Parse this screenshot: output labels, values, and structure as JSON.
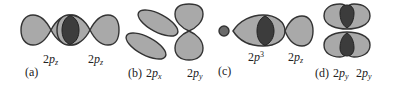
{
  "colors": {
    "lobe_fill": "#a9a9a9",
    "overlap_fill": "#3c3c3c",
    "outline": "#333333",
    "background": "#ffffff"
  },
  "panels": [
    {
      "id": "a",
      "tag": "(a)",
      "orbitals": [
        {
          "prefix": "2",
          "letter": "p",
          "sub": "z"
        },
        {
          "prefix": "2",
          "letter": "p",
          "sub": "z"
        }
      ],
      "description": "sigma overlap of two 2pz orbitals end-on"
    },
    {
      "id": "b",
      "tag": "(b)",
      "orbitals": [
        {
          "prefix": "2",
          "letter": "p",
          "sub": "x"
        },
        {
          "prefix": "2",
          "letter": "p",
          "sub": "y"
        }
      ],
      "description": "orthogonal 2px and 2py, no net overlap"
    },
    {
      "id": "c",
      "tag": "(c)",
      "orbitals": [
        {
          "prefix": "2",
          "letter": "p",
          "sup": "3"
        },
        {
          "prefix": "2",
          "letter": "p",
          "sub": "z"
        }
      ],
      "description": "sigma overlap of sp3 hybrid with 2pz"
    },
    {
      "id": "d",
      "tag": "(d)",
      "orbitals": [
        {
          "prefix": "2",
          "letter": "p",
          "sub": "y"
        },
        {
          "prefix": "2",
          "letter": "p",
          "sub": "y"
        }
      ],
      "description": "pi side-on overlap of two 2py orbitals"
    }
  ]
}
